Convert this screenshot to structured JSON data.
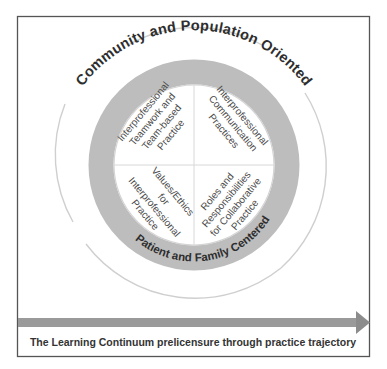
{
  "diagram": {
    "outer_label": "Community and Population Oriented",
    "ring_label": "Patient and Family Centered",
    "quadrants": {
      "top_left": [
        "Interprofessional",
        "Teamwork and",
        "Team-based",
        "Practice"
      ],
      "top_right": [
        "Interprofessional",
        "Communication",
        "Practices"
      ],
      "bottom_left": [
        "Values/Ethics",
        "for",
        "Interprofessional",
        "Practice"
      ],
      "bottom_right": [
        "Roles and",
        "Responsibilities",
        "for Collaborative",
        "Practice"
      ]
    },
    "caption": "The Learning Continuum prelicensure through practice trajectory",
    "colors": {
      "ring": "#bdbdbd",
      "arrow": "#9a9a9a",
      "frame": "#555555",
      "text": "#2e2e2e"
    }
  }
}
